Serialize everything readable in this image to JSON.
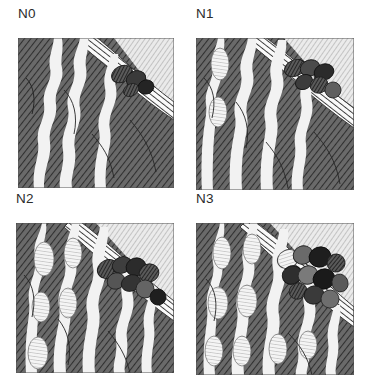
{
  "figure": {
    "type": "panel-grid",
    "rows": 2,
    "columns": 2,
    "background_color": "#ffffff",
    "style": "pen-and-ink cross-hatch illustration",
    "panels": [
      {
        "id": "n0",
        "label": "N0",
        "position": "top-left",
        "strand_count": 3,
        "bulb_count": 5,
        "blob_cluster_count": 4,
        "blob_cluster_size": "small",
        "tube_visible": true,
        "description": "Three pale wavy strands over dark cross-hatched ground with a banded diagonal tube and a small dark blob cluster at upper right."
      },
      {
        "id": "n1",
        "label": "N1",
        "position": "top-right",
        "strand_count": 4,
        "bulb_count": 7,
        "blob_cluster_count": 6,
        "blob_cluster_size": "medium",
        "tube_visible": true,
        "description": "Four pale wavy strands with shaded spindle bulbs; banded diagonal tube and a medium dark blob cluster at upper right."
      },
      {
        "id": "n2",
        "label": "N2",
        "position": "bottom-left",
        "strand_count": 5,
        "bulb_count": 9,
        "blob_cluster_count": 8,
        "blob_cluster_size": "large",
        "tube_visible": true,
        "description": "Five strands with striped spindle bulbs; banded tube sweeps across with a large dark blob cluster along its upper edge."
      },
      {
        "id": "n3",
        "label": "N3",
        "position": "bottom-right",
        "strand_count": 5,
        "bulb_count": 10,
        "blob_cluster_count": 11,
        "blob_cluster_size": "very-large",
        "tube_visible": true,
        "description": "Five striped strands with many spindle bulbs; the largest, densest dark blob cluster fills the upper right."
      }
    ]
  },
  "palette": {
    "paper": "#ffffff",
    "label_text": "#2b2b2b",
    "ground_dark": "#4a4a4a",
    "ground_mid": "#6d6d6d",
    "ground_light": "#c9c9c9",
    "sky_light": "#d8d8d8",
    "strand_pale": "#f2f2f2",
    "strand_shade": "#b8b8b8",
    "tube_band": "#ffffff",
    "blob_dark": "#2a2a2a",
    "blob_mid": "#5c5c5c",
    "ink": "#3a3a3a"
  }
}
